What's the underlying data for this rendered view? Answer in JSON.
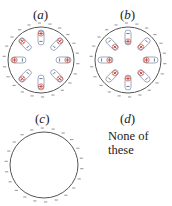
{
  "options": [
    {
      "id": "a",
      "label_open": "(",
      "label_letter": "a",
      "label_close": ")",
      "has_dipoles": true,
      "dipole_orientation": "positive-outward",
      "dipole_count": 8,
      "surface_charge": "negative"
    },
    {
      "id": "b",
      "label_open": "(",
      "label_letter": "b",
      "label_close": ")",
      "has_dipoles": true,
      "dipole_orientation": "negative-outward",
      "dipole_count": 8,
      "surface_charge": "negative"
    },
    {
      "id": "c",
      "label_open": "(",
      "label_letter": "c",
      "label_close": ")",
      "has_dipoles": false,
      "surface_charge": "negative"
    },
    {
      "id": "d",
      "label_open": "(",
      "label_letter": "d",
      "label_close": ")",
      "text_line1": "None of",
      "text_line2": "these"
    }
  ],
  "colors": {
    "circle_stroke": "#555555",
    "dipole_outline": "#8a96b0",
    "positive": "#c0392b",
    "negative": "#5a6a8a",
    "surface_charge": "#666666"
  }
}
